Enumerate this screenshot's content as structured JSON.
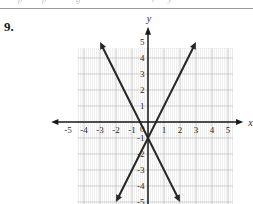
{
  "page": {
    "problem_number": "9.",
    "top_cropped_text": [
      "p",
      "p",
      "g",
      "t",
      "y"
    ]
  },
  "chart_data": {
    "type": "line",
    "title": "",
    "xlabel": "x",
    "ylabel": "y",
    "xlim": [
      -5.8,
      5.8
    ],
    "ylim": [
      -5.6,
      5.6
    ],
    "xticks": [
      -5,
      -4,
      -3,
      -2,
      -1,
      1,
      2,
      3,
      4,
      5
    ],
    "yticks": [
      5,
      4,
      3,
      2,
      1,
      -1,
      -2,
      -3,
      -4,
      -5
    ],
    "xtick_labels": [
      "-5",
      "-4",
      "-3",
      "-2",
      "-1",
      "1",
      "2",
      "3",
      "4",
      "5"
    ],
    "ytick_labels": [
      "5",
      "4",
      "3",
      "2",
      "1",
      "-1",
      "-2",
      "-3",
      "-4",
      "-5"
    ],
    "origin_label": "0",
    "grid": true,
    "grid_step": 1,
    "legend": "none",
    "axis_arrows": [
      "x-positive",
      "x-negative",
      "y-positive"
    ],
    "series": [
      {
        "name": "descending-line",
        "slope": -2,
        "intercept": -1,
        "x": [
          -3.0,
          2.0
        ],
        "y": [
          5.0,
          -5.0
        ],
        "arrow_start": true,
        "arrow_end": true
      },
      {
        "name": "ascending-line",
        "slope": 2,
        "intercept": -1,
        "x": [
          -2.0,
          3.0
        ],
        "y": [
          -5.0,
          5.0
        ],
        "arrow_start": true,
        "arrow_end": true
      }
    ],
    "intersection": {
      "x": 0,
      "y": -1
    },
    "shading": {
      "quadrant_light": "#e9e9e9",
      "quadrant_dark": "#cfcfcf",
      "grid_line": "#b4b4b4"
    },
    "colors": {
      "line": "#262626",
      "axis": "#1a1a1a",
      "label": "#1f1f1f",
      "background": "#ffffff"
    }
  }
}
